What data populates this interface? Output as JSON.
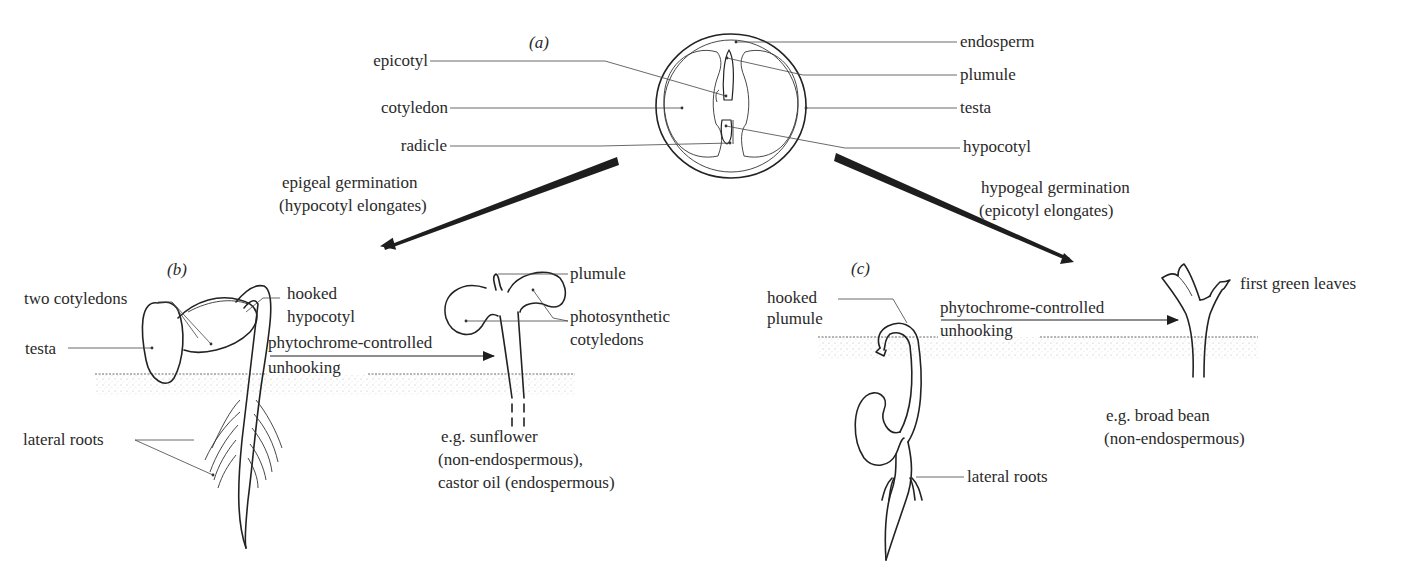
{
  "figure": {
    "panels": {
      "a": {
        "tag": "(a)",
        "title": "seed structure"
      },
      "b": {
        "tag": "(b)",
        "title": "epigeal seedling"
      },
      "c": {
        "tag": "(c)",
        "title": "hypogeal seedling"
      }
    },
    "seed_labels_left": [
      "epicotyl",
      "cotyledon",
      "radicle"
    ],
    "seed_labels_right": [
      "endosperm",
      "plumule",
      "testa",
      "hypocotyl"
    ],
    "epigeal": {
      "heading_line1": "epigeal germination",
      "heading_line2": "(hypocotyl elongates)",
      "labels": {
        "two_cotyledons": "two cotyledons",
        "testa": "testa",
        "hooked_line1": "hooked",
        "hooked_line2": "hypocotyl",
        "lateral_roots": "lateral roots",
        "plumule": "plumule",
        "photo_line1": "photosynthetic",
        "photo_line2": "cotyledons"
      },
      "arrow_line1": "phytochrome-controlled",
      "arrow_line2": "unhooking",
      "examples": [
        "e.g. sunflower",
        "(non-endospermous),",
        "castor oil (endospermous)"
      ]
    },
    "hypogeal": {
      "heading_line1": "hypogeal germination",
      "heading_line2": "(epicotyl elongates)",
      "labels": {
        "hooked_line1": "hooked",
        "hooked_line2": "plumule",
        "first_leaves": "first green leaves",
        "lateral_roots": "lateral roots"
      },
      "arrow_line1": "phytochrome-controlled",
      "arrow_line2": "unhooking",
      "examples": [
        "e.g. broad bean",
        "(non-endospermous)"
      ]
    },
    "colors": {
      "ink": "#222222",
      "label": "#2a2a2a",
      "soil": "#9a9a9a",
      "background": "#ffffff"
    }
  }
}
